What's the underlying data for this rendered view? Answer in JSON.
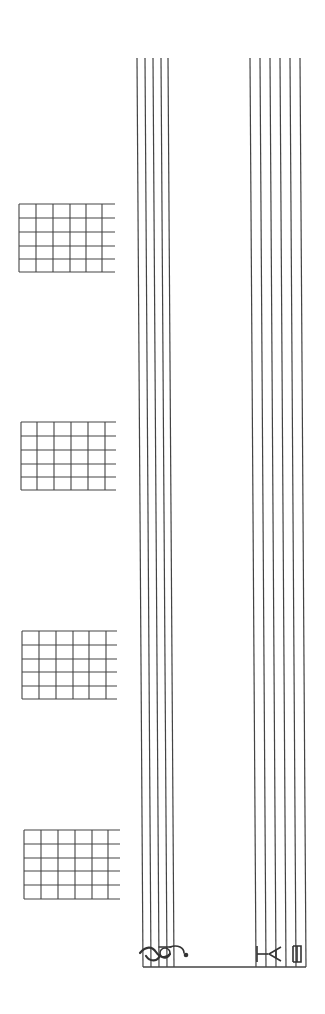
{
  "page": {
    "type": "guitar staff and tablature blank sheet",
    "orientation": "rotated 90 degrees",
    "background": "#ffffff",
    "ink_color": "#444444"
  },
  "staff": {
    "lines": 5,
    "clef": "treble-clef",
    "clef_glyph": "𝄞"
  },
  "tab": {
    "lines": 6,
    "label_letters": [
      "T",
      "A",
      "B"
    ]
  },
  "chord_diagrams": [
    {
      "index": 1,
      "strings": 6,
      "frets": 5
    },
    {
      "index": 2,
      "strings": 6,
      "frets": 5
    },
    {
      "index": 3,
      "strings": 6,
      "frets": 5
    },
    {
      "index": 4,
      "strings": 6,
      "frets": 5
    }
  ]
}
